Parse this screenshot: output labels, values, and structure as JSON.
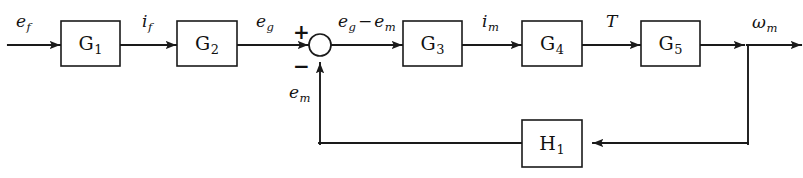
{
  "diagram": {
    "type": "control-system-block-diagram",
    "background_color": "#ffffff",
    "line_color": "#1a1a1a",
    "text_color": "#111111",
    "blocks": [
      {
        "id": "G1",
        "base": "G",
        "subscript": "1",
        "x": 61,
        "y": 21,
        "w": 59,
        "h": 45
      },
      {
        "id": "G2",
        "base": "G",
        "subscript": "2",
        "x": 177,
        "y": 21,
        "w": 60,
        "h": 45
      },
      {
        "id": "G3",
        "base": "G",
        "subscript": "3",
        "x": 403,
        "y": 21,
        "w": 59,
        "h": 45
      },
      {
        "id": "G4",
        "base": "G",
        "subscript": "4",
        "x": 522,
        "y": 21,
        "w": 60,
        "h": 45
      },
      {
        "id": "G5",
        "base": "G",
        "subscript": "5",
        "x": 641,
        "y": 21,
        "w": 59,
        "h": 45
      },
      {
        "id": "H1",
        "base": "H",
        "subscript": "1",
        "x": 522,
        "y": 120,
        "w": 60,
        "h": 47
      }
    ],
    "summing_junction": {
      "name": "summing-junction",
      "cx": 320,
      "cy": 45,
      "r": 11,
      "plus_sign": "+",
      "minus_sign": "−"
    },
    "signals": {
      "input": {
        "base": "e",
        "subscript": "f",
        "x": 16,
        "y": 13
      },
      "if": {
        "base": "i",
        "subscript": "f",
        "x": 142,
        "y": 13
      },
      "eg": {
        "base": "e",
        "subscript": "g",
        "x": 256,
        "y": 13
      },
      "error": {
        "base1": "e",
        "sub1": "g",
        "op": "−",
        "base2": "e",
        "sub2": "m",
        "x": 338,
        "y": 13
      },
      "im": {
        "base": "i",
        "subscript": "m",
        "x": 482,
        "y": 13
      },
      "torque": {
        "base": "T",
        "subscript": "",
        "x": 606,
        "y": 13
      },
      "output": {
        "base": "ω",
        "subscript": "m",
        "x": 752,
        "y": 14
      },
      "em": {
        "base": "e",
        "subscript": "m",
        "x": 289,
        "y": 84
      }
    },
    "geometry": {
      "forward_y": 45,
      "feedback_y": 143,
      "feedback_left_x": 320,
      "feedback_right_x": 748,
      "canvas_w": 803,
      "canvas_h": 178
    }
  }
}
